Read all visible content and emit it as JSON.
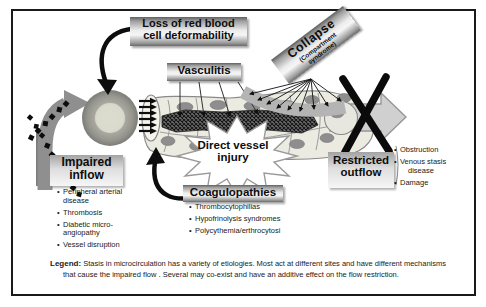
{
  "colors": {
    "background": "#ffffff",
    "line_black": "#141414",
    "mid_gray": "#8f8f8f",
    "vessel_fill": "#ebebe2",
    "band_gray": "#b4b4b4"
  },
  "figure": {
    "labels": {
      "loss": [
        "Loss of red blood",
        "cell deformability"
      ],
      "vasculitis": "Vasculitis",
      "collapse_title": "Collapse",
      "collapse_sub": [
        "(Compartment",
        "syndrome)"
      ],
      "impaired": [
        "Impaired",
        "inflow"
      ],
      "injury": [
        "Direct vessel",
        "injury"
      ],
      "coagulopathies": "Coagulopathies",
      "restricted": [
        "Restricted",
        "outflow"
      ]
    },
    "inflow_causes": [
      "Peripheral arterial disease",
      "Thrombosis",
      "Diabetic micro-angiopathy",
      "Vessel disruption"
    ],
    "coagulopathy_causes": [
      "Thrombocytophilias",
      "Hypofrinolysis syndromes",
      "Polycythemia/erthrocytosi"
    ],
    "outflow_causes": [
      "Obstruction",
      "Venous stasis disease",
      "Damage"
    ],
    "legend": {
      "label": "Legend:",
      "text": "Stasis in microcirculation has a variety of etiologies. Most act at different sites and have different mechanisms that cause the impaired flow .  Several may co-exist and have an additive effect on the flow restriction."
    }
  }
}
